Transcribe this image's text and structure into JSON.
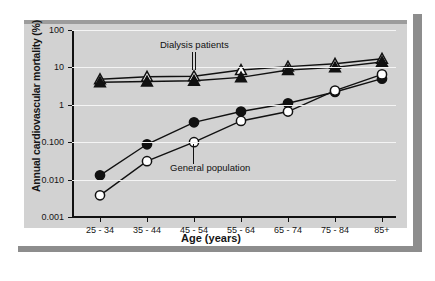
{
  "chart_data": {
    "type": "line",
    "title": "",
    "xlabel": "Age (years)",
    "ylabel": "Annual cardiovascular mortality (%)",
    "categories": [
      "25 - 34",
      "35 - 44",
      "45 - 54",
      "55 - 64",
      "65 - 74",
      "75 - 84",
      "85+"
    ],
    "ylim": [
      0.001,
      100
    ],
    "yscale": "log",
    "ytick_labels": [
      "100",
      "10",
      "1",
      "0.100",
      "0.010",
      "0.001"
    ],
    "ytick_values": [
      100,
      10,
      1,
      0.1,
      0.01,
      0.001
    ],
    "grid": true,
    "legend_position": "inline-annotations",
    "annotations": [
      {
        "text": "Dialysis patients",
        "points_to": "45 - 54"
      },
      {
        "text": "General population",
        "points_to": "45 - 54"
      }
    ],
    "series": [
      {
        "name": "Dialysis patients (open triangle)",
        "marker": "open-triangle",
        "color": "#ffffff",
        "edge_color": "#111111",
        "values": [
          4.8,
          5.6,
          5.8,
          8.5,
          10.5,
          12.5,
          17.0
        ]
      },
      {
        "name": "Dialysis patients (filled triangle)",
        "marker": "filled-triangle",
        "color": "#111111",
        "edge_color": "#111111",
        "values": [
          4.0,
          4.2,
          4.4,
          5.4,
          8.5,
          10.0,
          14.0
        ]
      },
      {
        "name": "General population (filled circle)",
        "marker": "filled-circle",
        "color": "#111111",
        "edge_color": "#111111",
        "values": [
          0.013,
          0.088,
          0.34,
          0.66,
          1.1,
          2.2,
          5.0
        ]
      },
      {
        "name": "General population (open circle)",
        "marker": "open-circle",
        "color": "#ffffff",
        "edge_color": "#111111",
        "values": [
          0.0038,
          0.031,
          0.1,
          0.37,
          0.66,
          2.4,
          6.5
        ]
      }
    ]
  },
  "figure": {
    "background_color": "#d2d2d2",
    "page_color": "#ffffff",
    "shadow_color": "#8d8d8d",
    "gridline_color": "#f4f4f4",
    "axis_color": "#111111"
  }
}
